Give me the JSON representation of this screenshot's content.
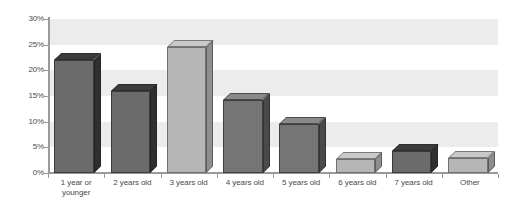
{
  "chart_data": {
    "type": "bar",
    "title": "",
    "subtitle": "",
    "xlabel": "",
    "ylabel": "",
    "ylim": [
      0,
      30
    ],
    "ytick_labels": [
      "0%",
      "5%",
      "10%",
      "15%",
      "20%",
      "25%",
      "30%"
    ],
    "ytick_values": [
      0,
      5,
      10,
      15,
      20,
      25,
      30
    ],
    "grid": false,
    "bands": true,
    "legend": "none",
    "value_suffix": "%",
    "categories": [
      "1 year or younger",
      "2 years old",
      "3 years old",
      "4 years old",
      "5 years old",
      "6 years old",
      "7 years old",
      "Other"
    ],
    "category_lines": [
      [
        "1 year or",
        "younger"
      ],
      [
        "2 years old"
      ],
      [
        "3 years old"
      ],
      [
        "4 years old"
      ],
      [
        "5 years old"
      ],
      [
        "6 years old"
      ],
      [
        "7 years old"
      ],
      [
        "Other"
      ]
    ],
    "values": [
      22,
      16,
      24.5,
      14.3,
      9.5,
      2.7,
      4.3,
      2.9
    ],
    "bar_shades": [
      "dark",
      "dark",
      "light",
      "mid",
      "mid",
      "light",
      "dark",
      "light"
    ]
  },
  "colors": {
    "bar_dark": "#6b6b6b",
    "bar_mid": "#757575",
    "bar_light": "#b6b6b6",
    "band": "#ececec",
    "axis": "#9a9a9a",
    "text": "#4a4a4a",
    "background": "#ffffff"
  }
}
